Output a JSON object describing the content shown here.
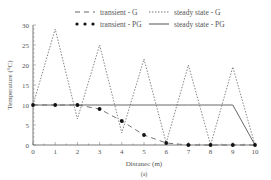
{
  "chart_data": {
    "type": "line",
    "title": "",
    "subtitle": "",
    "caption": "(a)",
    "xlabel": "Distanec (m)",
    "ylabel": "Temperature (°C)",
    "xlim": [
      0,
      10
    ],
    "ylim": [
      0,
      30
    ],
    "xticks": [
      0,
      1,
      2,
      3,
      4,
      5,
      6,
      7,
      8,
      9,
      10
    ],
    "yticks": [
      0,
      5,
      10,
      15,
      20,
      25,
      30
    ],
    "grid": false,
    "legend_position": "top",
    "x": [
      0,
      1,
      2,
      3,
      4,
      5,
      6,
      7,
      8,
      9,
      10
    ],
    "series": [
      {
        "name": "transient - G",
        "style": "dashed",
        "color": "#666666",
        "values": [
          10,
          10,
          10,
          9,
          6,
          2.5,
          0.5,
          0,
          0,
          0,
          0
        ]
      },
      {
        "name": "steady state - G",
        "style": "dotted",
        "color": "#777777",
        "values": [
          10,
          29,
          6.5,
          25,
          3,
          21.5,
          0.5,
          20,
          0,
          19.5,
          0
        ]
      },
      {
        "name": "transient - PG",
        "style": "markers",
        "color": "#111111",
        "values": [
          10,
          10,
          10,
          9,
          6,
          2.5,
          0.5,
          0,
          0,
          0,
          0
        ]
      },
      {
        "name": "steady state - PG",
        "style": "solid",
        "color": "#555555",
        "values": [
          10,
          10,
          10,
          10,
          10,
          10,
          10,
          10,
          10,
          10,
          0
        ]
      }
    ]
  },
  "legend": {
    "items": [
      {
        "label": "transient - G"
      },
      {
        "label": "steady state - G"
      },
      {
        "label": "transient - PG"
      },
      {
        "label": "steady state - PG"
      }
    ]
  }
}
